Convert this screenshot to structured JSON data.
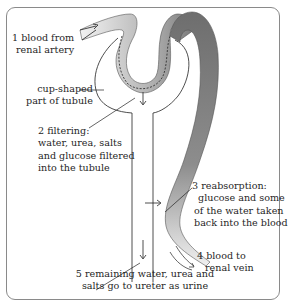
{
  "colors": {
    "blood_dark": "#6f6f6f",
    "blood_light": "#e6e6e6",
    "outline": "#3a3a3a",
    "frame": "#8a8a8a",
    "text": "#1f1f1f"
  },
  "labels": {
    "step1": {
      "line1": "1 blood from",
      "line2": "renal artery"
    },
    "cup": {
      "line1": "cup-shaped",
      "line2": "part of tubule"
    },
    "step2": {
      "line1": "2 filtering:",
      "line2": "water, urea, salts",
      "line3": "and glucose filtered",
      "line4": "into the tubule"
    },
    "step3": {
      "line1": "3 reabsorption:",
      "line2": "glucose and some",
      "line3": "of the water taken",
      "line4": "back into the blood"
    },
    "step4": {
      "line1": "4 blood to",
      "line2": "renal vein"
    },
    "step5": {
      "line1": "5 remaining water, urea and",
      "line2": "salts go to ureter as urine"
    }
  }
}
